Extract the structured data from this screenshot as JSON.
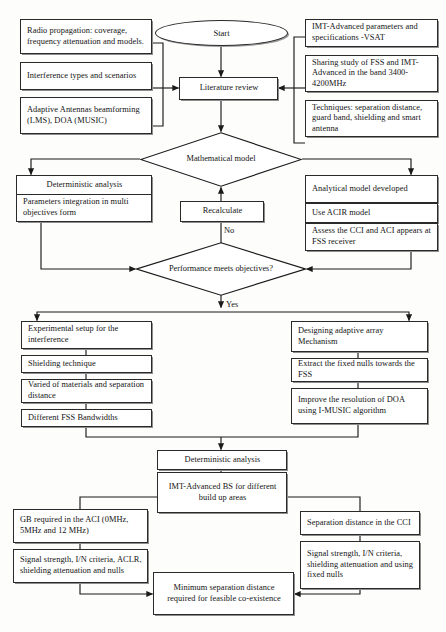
{
  "diagram": {
    "stroke_color": "#2a2a2a",
    "shadow_color": "#8e8e8e",
    "background": "#fdfdfc"
  },
  "nodes": {
    "start": "Start",
    "radio_propagation": "Radio propagation: coverage, frequency attenuation and models.",
    "interference_types": "Interference types and scenarios",
    "adaptive_antennas": "Adaptive Antennas beamforming (LMS), DOA (MUSIC)",
    "imt_parameters": "IMT-Advanced parameters and specifications -VSAT",
    "sharing_study": "Sharing study of FSS and IMT-Advanced in the band 3400-4200MHz",
    "techniques": "Techniques: separation distance, guard band, shielding and smart antenna",
    "literature_review": "Literature review",
    "mathematical_model": "Mathematical model",
    "deterministic_analysis_1": "Deterministic analysis",
    "parameters_integration": "Parameters integration in multi objectives form",
    "analytical_model": "Analytical model developed",
    "use_acir": "Use ACIR model",
    "assess_cci_aci": "Assess the CCI and ACI appears at FSS receiver",
    "recalculate": "Recalculate",
    "performance_check": "Performance meets objectives?",
    "experimental_setup": "Experimental setup for the interference",
    "shielding_technique": "Shielding technique",
    "varied_materials": "Varied of materials and separation distance",
    "different_fss_bandwidths": "Different FSS Bandwidths",
    "designing_adaptive_array": "Designing adaptive array Mechanism",
    "extract_fixed_nulls": "Extract the fixed nulls towards the FSS",
    "improve_resolution": "Improve the resolution of DOA using I-MUSIC algorithm",
    "deterministic_analysis_2": "Deterministic analysis",
    "imt_bs_areas": "IMT-Advanced BS for different build up areas",
    "gb_required": "GB required in the ACI (0MHz, 5MHz and 12 MHz)",
    "signal_strength_left": "Signal strength, I/N criteria, ACLR, shielding attenuation and nulls",
    "separation_distance_cci": "Separation distance in the CCI",
    "signal_strength_right": "Signal strength, I/N criteria, shielding attenuation and using fixed nulls",
    "minimum_separation": "Minimum separation distance required for feasible co-existence"
  },
  "edge_labels": {
    "no": "No",
    "yes": "Yes"
  }
}
